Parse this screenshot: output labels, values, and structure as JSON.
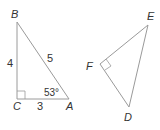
{
  "triangles": [
    {
      "name": "ABC",
      "vertices": {
        "A": "A",
        "B": "B",
        "C": "C"
      },
      "sides": {
        "BC": "4",
        "AB": "5",
        "CA": "3"
      },
      "angle_A": "53°",
      "right_angle_at": "C"
    },
    {
      "name": "DEF",
      "vertices": {
        "D": "D",
        "E": "E",
        "F": "F"
      },
      "right_angle_at": "F"
    }
  ],
  "colors": {
    "line": "#9a9a9a",
    "text": "#333333"
  }
}
